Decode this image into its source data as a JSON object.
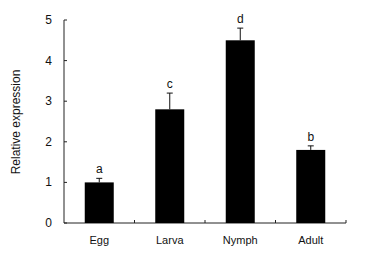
{
  "chart_data": {
    "type": "bar",
    "title": "",
    "xlabel": "",
    "ylabel": "Relative expression",
    "ylim": [
      0,
      5
    ],
    "yticks": [
      0,
      1,
      2,
      3,
      4,
      5
    ],
    "categories": [
      "Egg",
      "Larva",
      "Nymph",
      "Adult"
    ],
    "values": [
      1.0,
      2.8,
      4.5,
      1.8
    ],
    "errors": [
      0.1,
      0.4,
      0.3,
      0.1
    ],
    "significance_letters": [
      "a",
      "c",
      "d",
      "b"
    ],
    "grid": false,
    "legend": null,
    "bar_color": "#000000"
  }
}
